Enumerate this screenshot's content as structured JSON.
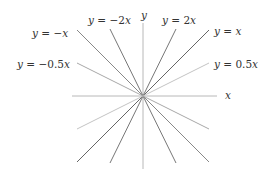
{
  "diagram": {
    "title": "",
    "center": {
      "x": 143,
      "y": 96
    },
    "axes": {
      "x": {
        "label": "x",
        "x1": 72,
        "y1": 96,
        "x2": 217,
        "y2": 96,
        "label_x": 225,
        "label_y": 99,
        "color": "#b8b8b8"
      },
      "y": {
        "label": "y",
        "x1": 143,
        "y1": 23,
        "x2": 143,
        "y2": 169,
        "label_x": 144,
        "label_y": 19,
        "color": "#b8b8b8"
      }
    },
    "lines": [
      {
        "id": "y-eq-2x",
        "label": "y = 2x",
        "slope": 2,
        "x1": 176,
        "y1": 29,
        "x2": 110,
        "y2": 163,
        "color": "#777777",
        "label_x": 162,
        "label_y": 24
      },
      {
        "id": "y-eq-neg-2x",
        "label": "y = −2x",
        "slope": -2,
        "x1": 110,
        "y1": 29,
        "x2": 176,
        "y2": 163,
        "color": "#777777",
        "label_x": 88,
        "label_y": 24
      },
      {
        "id": "y-eq-x",
        "label": "y = x",
        "slope": 1,
        "x1": 209,
        "y1": 30,
        "x2": 77,
        "y2": 162,
        "color": "#666666",
        "label_x": 214,
        "label_y": 35
      },
      {
        "id": "y-eq-neg-x",
        "label": "y = −x",
        "slope": -1,
        "x1": 77,
        "y1": 30,
        "x2": 209,
        "y2": 162,
        "color": "#888888",
        "label_x": 32,
        "label_y": 37
      },
      {
        "id": "y-eq-0.5x",
        "label": "y = 0.5x",
        "slope": 0.5,
        "x1": 209,
        "y1": 63,
        "x2": 77,
        "y2": 129,
        "color": "#c4c4c4",
        "label_x": 214,
        "label_y": 68
      },
      {
        "id": "y-eq-neg-0.5x",
        "label": "y = −0.5x",
        "slope": -0.5,
        "x1": 77,
        "y1": 63,
        "x2": 209,
        "y2": 129,
        "color": "#a8a8a8",
        "label_x": 17,
        "label_y": 68
      }
    ]
  }
}
